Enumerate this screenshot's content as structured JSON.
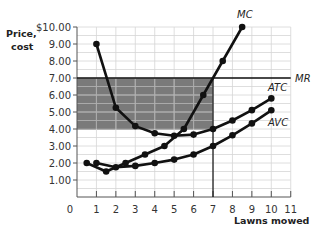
{
  "chart_data": {
    "type": "line",
    "title": "",
    "xlabel": "Lawns mowed",
    "ylabel": "Price, cost",
    "xlim": [
      0,
      11
    ],
    "ylim": [
      0,
      10
    ],
    "grid": true,
    "x_ticks": [
      "0",
      "1",
      "2",
      "3",
      "4",
      "5",
      "6",
      "7",
      "8",
      "9",
      "10",
      "11"
    ],
    "y_ticks": [
      "1.00",
      "2.00",
      "3.00",
      "4.00",
      "5.00",
      "6.00",
      "7.00",
      "8.00",
      "9.00",
      "$10.00"
    ],
    "series": [
      {
        "name": "MC",
        "x": [
          0.5,
          1.5,
          2.5,
          3.5,
          4.5,
          5.5,
          6.5,
          7.5,
          8.5
        ],
        "values": [
          2.0,
          1.5,
          2.0,
          2.5,
          3.0,
          4.0,
          6.0,
          8.0,
          10.0
        ]
      },
      {
        "name": "ATC",
        "x": [
          1,
          2,
          3,
          4,
          5,
          6,
          7,
          8,
          9,
          10
        ],
        "values": [
          9.0,
          5.25,
          4.17,
          3.75,
          3.6,
          3.67,
          4.0,
          4.5,
          5.11,
          5.8
        ]
      },
      {
        "name": "AVC",
        "x": [
          1,
          2,
          3,
          4,
          5,
          6,
          7,
          8,
          9,
          10
        ],
        "values": [
          2.0,
          1.75,
          1.83,
          2.0,
          2.2,
          2.5,
          3.0,
          3.63,
          4.33,
          5.1
        ]
      },
      {
        "name": "MR",
        "x": [
          0,
          11
        ],
        "values": [
          7.0,
          7.0
        ]
      }
    ],
    "annotations": [
      {
        "type": "shaded_rect",
        "x": [
          0,
          7
        ],
        "y": [
          4.0,
          7.0
        ],
        "color": "#7a7a7a",
        "meaning": "profit"
      },
      {
        "type": "vline",
        "x": 7,
        "y": [
          0,
          7.0
        ]
      }
    ],
    "legend": "curve labels at line ends"
  },
  "labels": {
    "ylabel_line1": "Price,",
    "ylabel_line2": "cost",
    "xlabel": "Lawns mowed",
    "mc": "MC",
    "mr": "MR",
    "atc": "ATC",
    "avc": "AVC",
    "origin": "0"
  },
  "colors": {
    "shade": "#7a7a7a",
    "grid": "#d6d6d6",
    "grid_in_shade": "#a3a3a3",
    "curve": "#111111",
    "axis": "#555555"
  }
}
